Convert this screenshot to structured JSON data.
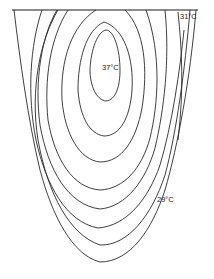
{
  "figure": {
    "type": "isotherm-contour-diagram",
    "labels": {
      "max": "37°C",
      "surface_edge": "31°C",
      "outer": "29°C"
    },
    "contour_count": 8,
    "colors": {
      "line": "#2a2a2a",
      "background": "#ffffff",
      "text": "#222222"
    }
  }
}
